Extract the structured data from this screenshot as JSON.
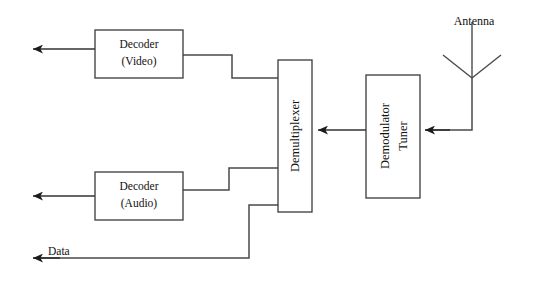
{
  "diagram": {
    "canvas": {
      "width": 544,
      "height": 288,
      "background": "#ffffff"
    },
    "stroke_color": "#4a4a4a",
    "text_color": "#111111",
    "blocks": [
      {
        "id": "decoder-video",
        "line1": "Decoder",
        "line2": "(Video)",
        "orientation": "horizontal",
        "x": 95,
        "y": 30,
        "w": 88,
        "h": 48
      },
      {
        "id": "decoder-audio",
        "line1": "Decoder",
        "line2": "(Audio)",
        "orientation": "horizontal",
        "x": 95,
        "y": 172,
        "w": 88,
        "h": 48
      },
      {
        "id": "demultiplexer",
        "line1": "Demultiplexer",
        "line2": "",
        "orientation": "vertical",
        "x": 278,
        "y": 60,
        "w": 34,
        "h": 152
      },
      {
        "id": "demodulator-tuner",
        "line1": "Demodulator",
        "line2": "Tuner",
        "orientation": "vertical",
        "x": 366,
        "y": 75,
        "w": 54,
        "h": 123
      }
    ],
    "labels": {
      "antenna": "Antenna",
      "data": "Data"
    },
    "signals": [
      {
        "id": "video-out",
        "label": "",
        "direction": "left"
      },
      {
        "id": "audio-out",
        "label": "",
        "direction": "left"
      },
      {
        "id": "data-out",
        "label": "Data",
        "direction": "left"
      },
      {
        "id": "antenna-to-demodulator",
        "label": "",
        "direction": "left"
      },
      {
        "id": "demodulator-to-demux",
        "label": "",
        "direction": "left"
      }
    ]
  }
}
